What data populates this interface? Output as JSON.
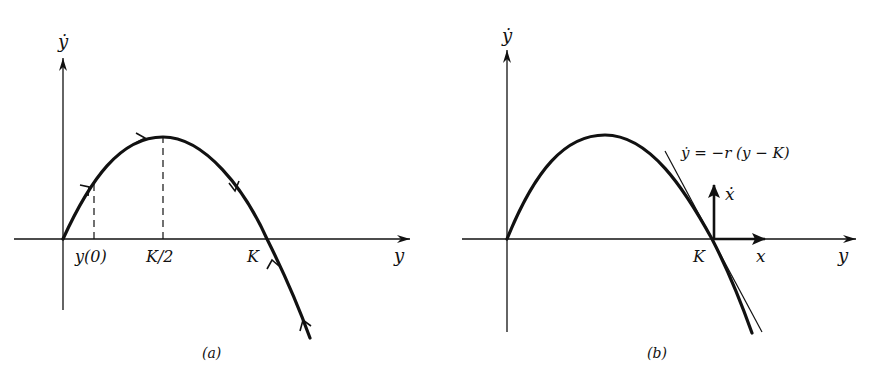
{
  "figure": {
    "panels": [
      {
        "id": "a",
        "caption": "(a)",
        "vertical_axis_label": "ẏ",
        "horizontal_axis_label": "y",
        "tick_labels": {
          "y0": "y(0)",
          "half_k": "K/2",
          "k": "K"
        },
        "description": "Logistic phase curve ẏ = r y (1 − y/K) with flow arrows moving toward the stable equilibrium K; dashed lines at y(0) and K/2"
      },
      {
        "id": "b",
        "caption": "(b)",
        "vertical_axis_label": "ẏ",
        "horizontal_axis_label": "y",
        "tick_labels": {
          "k": "K"
        },
        "tangent_equation": "ẏ = −r (y − K)",
        "local_axes": {
          "x_label": "x",
          "xdot_label": "ẋ"
        },
        "description": "Linearization about y = K: tangent line and local coordinates x = y − K"
      }
    ]
  },
  "colors": {
    "ink": "#111111",
    "background": "#ffffff"
  }
}
